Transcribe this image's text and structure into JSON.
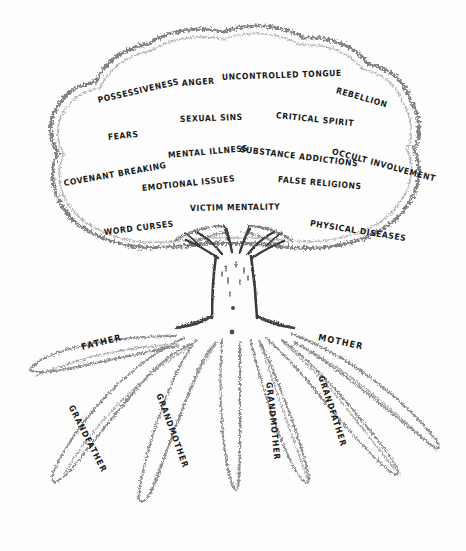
{
  "diagram": {
    "background_color": "#fdfdfd",
    "ink_color": "#2b2b2b",
    "canvas": {
      "width": 466,
      "height": 551
    }
  },
  "cloud": {
    "name": "foliage-cloud",
    "labels": [
      {
        "text": "POSSESSIVENESS",
        "x": 98,
        "y": 97,
        "rot": -13
      },
      {
        "text": "ANGER",
        "x": 182,
        "y": 80,
        "rot": -4
      },
      {
        "text": "UNCONTROLLED TONGUE",
        "x": 222,
        "y": 74,
        "rot": -2
      },
      {
        "text": "REBELLION",
        "x": 336,
        "y": 87,
        "rot": 16
      },
      {
        "text": "SEXUAL SINS",
        "x": 180,
        "y": 116,
        "rot": -2
      },
      {
        "text": "CRITICAL SPIRIT",
        "x": 276,
        "y": 112,
        "rot": 6
      },
      {
        "text": "FEARS",
        "x": 108,
        "y": 134,
        "rot": -6
      },
      {
        "text": "MENTAL ILLNESS",
        "x": 168,
        "y": 152,
        "rot": -5
      },
      {
        "text": "SUBSTANCE ADDICTIONS",
        "x": 240,
        "y": 146,
        "rot": 7
      },
      {
        "text": "OCCULT INVOLVEMENT",
        "x": 332,
        "y": 148,
        "rot": 15
      },
      {
        "text": "COVENANT BREAKING",
        "x": 64,
        "y": 180,
        "rot": -10
      },
      {
        "text": "EMOTIONAL ISSUES",
        "x": 142,
        "y": 185,
        "rot": -6
      },
      {
        "text": "FALSE RELIGIONS",
        "x": 278,
        "y": 176,
        "rot": 5
      },
      {
        "text": "VICTIM MENTALITY",
        "x": 190,
        "y": 205,
        "rot": -1
      },
      {
        "text": "WORD CURSES",
        "x": 104,
        "y": 229,
        "rot": -7
      },
      {
        "text": "PHYSICAL DISEASES",
        "x": 310,
        "y": 220,
        "rot": 9
      }
    ]
  },
  "ground": {
    "name": "ground-line",
    "labels": [
      {
        "text": "FATHER",
        "x": 82,
        "y": 344,
        "rot": -14
      },
      {
        "text": "MOTHER",
        "x": 318,
        "y": 334,
        "rot": 12
      }
    ]
  },
  "roots": {
    "name": "root-system",
    "labels": [
      {
        "text": "GRANDFATHER",
        "x": 70,
        "y": 402,
        "rot": 63
      },
      {
        "text": "GRANDMOTHER",
        "x": 158,
        "y": 390,
        "rot": 70
      },
      {
        "text": "GRANDMOTHER",
        "x": 268,
        "y": 378,
        "rot": 84
      },
      {
        "text": "GRANDFATHER",
        "x": 320,
        "y": 372,
        "rot": 72
      }
    ]
  },
  "trunk": {
    "name": "tree-trunk"
  }
}
